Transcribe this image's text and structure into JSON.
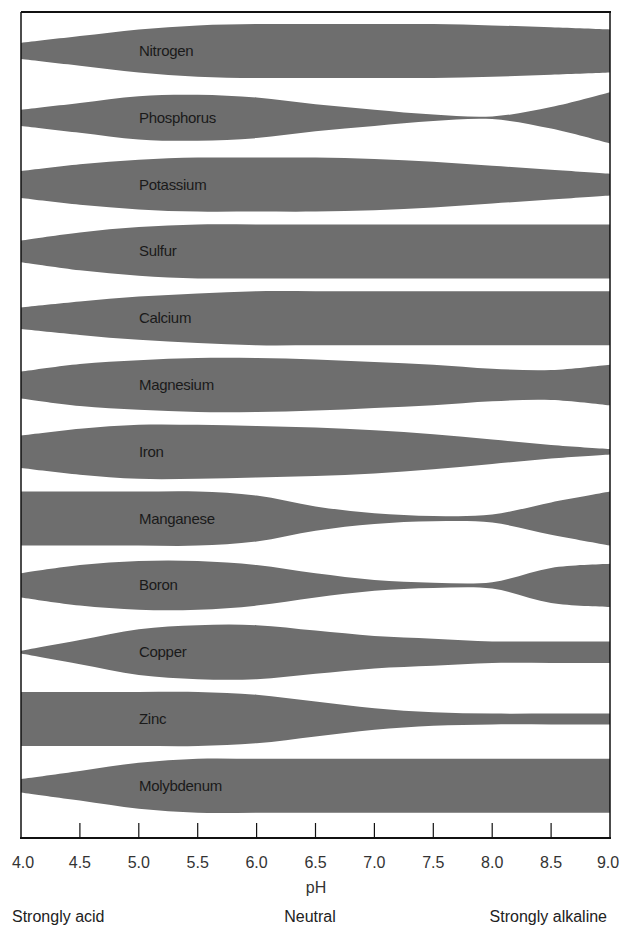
{
  "chart_data": {
    "type": "area",
    "title": "",
    "xlabel": "pH",
    "ylabel": "",
    "xlim": [
      4.0,
      9.0
    ],
    "grid": false,
    "legend": "none",
    "x": [
      4.0,
      4.5,
      5.0,
      5.5,
      6.0,
      6.5,
      7.0,
      7.5,
      8.0,
      8.5,
      9.0
    ],
    "tick_labels": [
      "4.0",
      "4.5",
      "5.0",
      "5.5",
      "6.0",
      "6.5",
      "7.0",
      "7.5",
      "8.0",
      "8.5",
      "9.0"
    ],
    "scale_labels": {
      "left": "Strongly acid",
      "center": "Neutral",
      "right": "Strongly alkaline"
    },
    "value_meaning": "Relative nutrient availability (band thickness, 0-1)",
    "series": [
      {
        "name": "Nitrogen",
        "values": [
          0.3,
          0.55,
          0.8,
          0.95,
          1.0,
          1.0,
          1.0,
          1.0,
          0.95,
          0.88,
          0.8
        ]
      },
      {
        "name": "Phosphorus",
        "values": [
          0.3,
          0.55,
          0.8,
          0.85,
          0.75,
          0.5,
          0.3,
          0.12,
          0.05,
          0.4,
          0.95
        ]
      },
      {
        "name": "Potassium",
        "values": [
          0.5,
          0.75,
          0.92,
          1.0,
          1.0,
          1.0,
          0.95,
          0.85,
          0.7,
          0.55,
          0.4
        ]
      },
      {
        "name": "Sulfur",
        "values": [
          0.4,
          0.7,
          0.9,
          1.0,
          1.0,
          1.0,
          1.0,
          1.0,
          1.0,
          1.0,
          1.0
        ]
      },
      {
        "name": "Calcium",
        "values": [
          0.4,
          0.62,
          0.8,
          0.92,
          1.0,
          1.0,
          1.0,
          1.0,
          1.0,
          1.0,
          1.0
        ]
      },
      {
        "name": "Magnesium",
        "values": [
          0.5,
          0.78,
          0.92,
          1.0,
          1.0,
          0.95,
          0.85,
          0.75,
          0.6,
          0.55,
          0.75
        ]
      },
      {
        "name": "Iron",
        "values": [
          0.6,
          0.85,
          1.0,
          1.0,
          0.95,
          0.9,
          0.8,
          0.65,
          0.45,
          0.25,
          0.1
        ]
      },
      {
        "name": "Manganese",
        "values": [
          1.0,
          1.0,
          1.0,
          1.0,
          0.85,
          0.45,
          0.2,
          0.1,
          0.15,
          0.6,
          1.0
        ]
      },
      {
        "name": "Boron",
        "values": [
          0.45,
          0.75,
          0.9,
          0.9,
          0.75,
          0.45,
          0.2,
          0.1,
          0.12,
          0.65,
          0.8
        ]
      },
      {
        "name": "Copper",
        "values": [
          0.05,
          0.45,
          0.85,
          1.0,
          1.0,
          0.8,
          0.6,
          0.5,
          0.4,
          0.4,
          0.4
        ]
      },
      {
        "name": "Zinc",
        "values": [
          1.0,
          1.0,
          1.0,
          1.0,
          0.9,
          0.65,
          0.4,
          0.25,
          0.2,
          0.2,
          0.2
        ]
      },
      {
        "name": "Molybdenum",
        "values": [
          0.25,
          0.55,
          0.85,
          1.0,
          1.0,
          1.0,
          1.0,
          1.0,
          1.0,
          1.0,
          1.0
        ]
      }
    ]
  },
  "colors": {
    "band": "#6e6e6e",
    "frame": "#111111",
    "text": "#1a1a1a"
  }
}
